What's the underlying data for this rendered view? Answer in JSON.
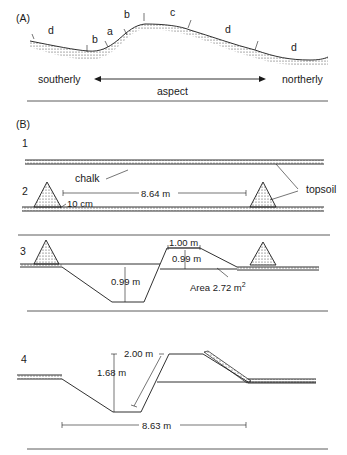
{
  "panel_a": {
    "label": "(A)",
    "zones": [
      "d",
      "b",
      "a",
      "b",
      "c",
      "d",
      "d"
    ],
    "southerly": "southerly",
    "northerly": "northerly",
    "aspect": "aspect"
  },
  "panel_b": {
    "label": "(B)",
    "stage1": {
      "number": "1",
      "chalk": "chalk",
      "topsoil": "topsoil"
    },
    "stage2": {
      "number": "2",
      "width": "8.64 m",
      "depth": "10 cm"
    },
    "stage3": {
      "number": "3",
      "top_width": "1.00 m",
      "bank_height": "0.99 m",
      "ditch_depth": "0.99 m",
      "area": "Area 2.72 m",
      "area_sup": "2"
    },
    "stage4": {
      "number": "4",
      "slope": "2.00 m",
      "depth": "1.68 m",
      "width": "8.63 m"
    }
  },
  "colors": {
    "ink": "#1a1a1a",
    "background": "#ffffff"
  }
}
